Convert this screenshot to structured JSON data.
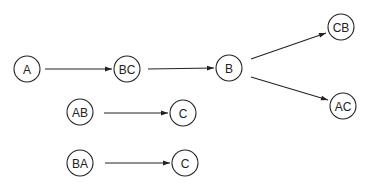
{
  "diagram": {
    "type": "tree-transitions",
    "colors": {
      "stroke": "#222222",
      "background": "#ffffff"
    },
    "nodes": [
      {
        "id": "A",
        "label": "A",
        "cx": 27,
        "cy": 69,
        "r": 13
      },
      {
        "id": "BC",
        "label": "BC",
        "cx": 127,
        "cy": 69,
        "r": 13
      },
      {
        "id": "B",
        "label": "B",
        "cx": 229,
        "cy": 68,
        "r": 13
      },
      {
        "id": "CB",
        "label": "CB",
        "cx": 341,
        "cy": 27,
        "r": 13
      },
      {
        "id": "AC",
        "label": "AC",
        "cx": 343,
        "cy": 106,
        "r": 13
      },
      {
        "id": "AB",
        "label": "AB",
        "cx": 80,
        "cy": 112,
        "r": 13
      },
      {
        "id": "C1",
        "label": "C",
        "cx": 183,
        "cy": 113,
        "r": 13
      },
      {
        "id": "BA",
        "label": "BA",
        "cx": 80,
        "cy": 163,
        "r": 13
      },
      {
        "id": "C2",
        "label": "C",
        "cx": 185,
        "cy": 163,
        "r": 13
      }
    ],
    "edges": [
      {
        "from": "A",
        "to": "BC",
        "x1": 45,
        "y1": 69,
        "x2": 112,
        "y2": 69
      },
      {
        "from": "BC",
        "to": "B",
        "x1": 148,
        "y1": 69,
        "x2": 214,
        "y2": 68
      },
      {
        "from": "B",
        "to": "CB",
        "x1": 251,
        "y1": 59,
        "x2": 326,
        "y2": 33
      },
      {
        "from": "B",
        "to": "AC",
        "x1": 251,
        "y1": 77,
        "x2": 328,
        "y2": 100
      },
      {
        "from": "AB",
        "to": "C1",
        "x1": 104,
        "y1": 113,
        "x2": 168,
        "y2": 113
      },
      {
        "from": "BA",
        "to": "C2",
        "x1": 105,
        "y1": 163,
        "x2": 170,
        "y2": 163
      }
    ]
  }
}
